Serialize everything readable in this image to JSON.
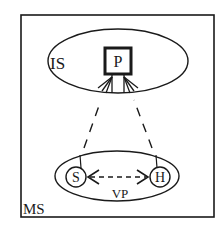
{
  "diagram": {
    "outer_box": {
      "label": "MS"
    },
    "upper_region": {
      "label": "IS"
    },
    "central_node": {
      "label": "P"
    },
    "lower_region": {
      "label": "VP"
    },
    "left_node": {
      "label": "S"
    },
    "right_node": {
      "label": "H"
    },
    "connections": [
      {
        "from": "S",
        "to": "P",
        "style": "dashed"
      },
      {
        "from": "H",
        "to": "P",
        "style": "dashed"
      },
      {
        "from": "S",
        "to": "H",
        "style": "dashed-bidirectional"
      }
    ],
    "colors": {
      "stroke": "#1a1a1a",
      "background": "#ffffff"
    }
  }
}
